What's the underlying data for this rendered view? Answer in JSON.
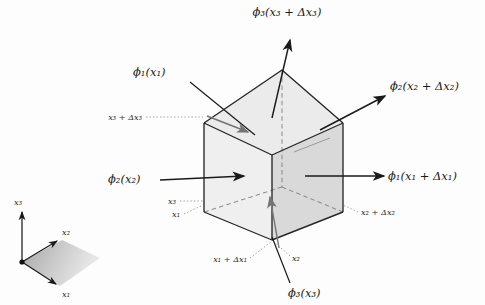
{
  "figure": {
    "type": "3d-control-volume-diagram",
    "background_color": "#fdfdfd",
    "ink_color": "#1a1a1a"
  },
  "colors": {
    "top_face": "#ebebeb",
    "left_face": "#efefef",
    "right_face": "#d8d8d8",
    "bottom_face": "#e4e4e4",
    "edge_solid": "#262626",
    "edge_hidden": "#8c8c8c",
    "leader_dotted": "#9a9a9a",
    "arrow_dark": "#1a1a1a",
    "arrow_gray": "#6f6f6f",
    "legend_fill_start": "#9f9f9f",
    "legend_fill_end": "#e8e8e8"
  },
  "flux_labels": [
    {
      "id": "phi3-top",
      "name": "flux-label-phi3-top",
      "text": "ϕ₃(x₃ + Δx₃)",
      "x": 287,
      "y": 16,
      "anchor": "middle",
      "arrow": "out-up",
      "face": "top"
    },
    {
      "id": "phi2-right",
      "name": "flux-label-phi2-plus",
      "text": "ϕ₂(x₂ + Δx₂)",
      "x": 390,
      "y": 90,
      "anchor": "start",
      "arrow": "out-up-right",
      "face": "back-right"
    },
    {
      "id": "phi1-right",
      "name": "flux-label-phi1-plus",
      "text": "ϕ₁(x₁ + Δx₁)",
      "x": 388,
      "y": 180,
      "anchor": "start",
      "arrow": "out-right",
      "face": "right"
    },
    {
      "id": "phi1-left",
      "name": "flux-label-phi1",
      "text": "ϕ₁(x₁)",
      "x": 133,
      "y": 76,
      "anchor": "start",
      "arrow": "in-down-right",
      "face": "top-left"
    },
    {
      "id": "phi2-left",
      "name": "flux-label-phi2",
      "text": "ϕ₂(x₂)",
      "x": 108,
      "y": 183,
      "anchor": "start",
      "arrow": "in-right",
      "face": "left"
    },
    {
      "id": "phi3-bottom",
      "name": "flux-label-phi3",
      "text": "ϕ₃(x₃)",
      "x": 288,
      "y": 297,
      "anchor": "start",
      "arrow": "in-up",
      "face": "bottom"
    }
  ],
  "coordinate_labels": [
    {
      "id": "x3-dx3",
      "name": "coord-label-x3-plus-dx3",
      "text": "x₃ + Δx₃",
      "x": 142,
      "y": 120,
      "anchor": "end",
      "leader": "dotted-horizontal"
    },
    {
      "id": "x3",
      "name": "coord-label-x3",
      "text": "x₃",
      "x": 176,
      "y": 204,
      "anchor": "end",
      "leader": "dotted-horizontal"
    },
    {
      "id": "x1",
      "name": "coord-label-x1",
      "text": "x₁",
      "x": 180,
      "y": 217,
      "anchor": "end",
      "leader": "dotted-diagonal"
    },
    {
      "id": "x1-dx1",
      "name": "coord-label-x1-plus-dx1",
      "text": "x₁ + Δx₁",
      "x": 247,
      "y": 262,
      "anchor": "end",
      "leader": "dotted-diagonal"
    },
    {
      "id": "x2",
      "name": "coord-label-x2",
      "text": "x₂",
      "x": 292,
      "y": 261,
      "anchor": "start",
      "leader": "dotted-vertical"
    },
    {
      "id": "x2-dx2",
      "name": "coord-label-x2-plus-dx2",
      "text": "x₂ + Δx₂",
      "x": 361,
      "y": 215,
      "anchor": "start",
      "leader": "dotted-diagonal"
    }
  ],
  "legend": {
    "name": "coordinate-axes-legend",
    "origin": {
      "x": 22,
      "y": 262
    },
    "axes": [
      {
        "id": "x3",
        "name": "legend-axis-x3",
        "text": "x₃",
        "label_x": 18,
        "label_y": 204,
        "tip_x": 22,
        "tip_y": 215
      },
      {
        "id": "x2",
        "name": "legend-axis-x2",
        "text": "x₂",
        "label_x": 64,
        "label_y": 234,
        "tip_x": 58,
        "tip_y": 243
      },
      {
        "id": "x1",
        "name": "legend-axis-x1",
        "text": "x₁",
        "label_x": 64,
        "label_y": 295,
        "tip_x": 57,
        "tip_y": 283
      }
    ]
  },
  "cube": {
    "name": "control-volume-cube",
    "vertices": {
      "front_bottom": {
        "x": 272,
        "y": 240
      },
      "front_top": {
        "x": 272,
        "y": 155
      },
      "left_bottom": {
        "x": 204,
        "y": 212
      },
      "left_top": {
        "x": 204,
        "y": 123
      },
      "right_bottom": {
        "x": 343,
        "y": 212
      },
      "right_top": {
        "x": 343,
        "y": 123
      },
      "back_top": {
        "x": 282,
        "y": 70
      },
      "back_bottom": {
        "x": 282,
        "y": 160
      }
    }
  }
}
